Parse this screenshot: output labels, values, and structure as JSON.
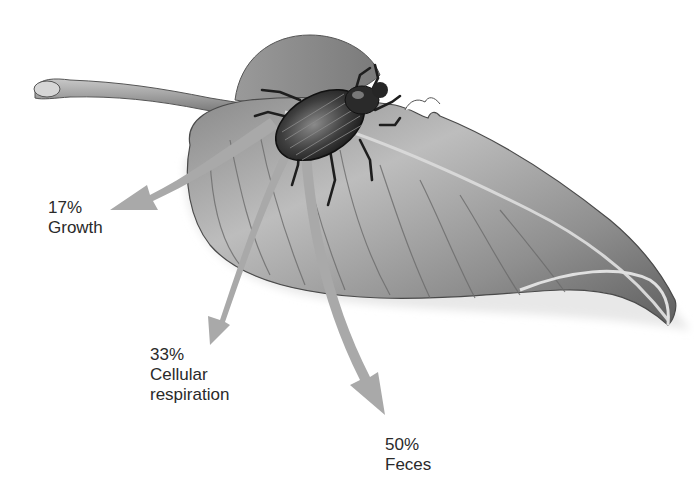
{
  "diagram": {
    "elements": {
      "organism": "beetle",
      "food_source": "leaf"
    },
    "colors": {
      "arrow": "#a9a9a9",
      "leaf_dark": "#6e6e6e",
      "leaf_light": "#cfcfcf",
      "text": "#2a2a2a",
      "background": "#ffffff"
    },
    "labels": [
      {
        "percent": "17%",
        "line1": "Growth",
        "line2": ""
      },
      {
        "percent": "33%",
        "line1": "Cellular",
        "line2": "respiration"
      },
      {
        "percent": "50%",
        "line1": "Feces",
        "line2": ""
      }
    ]
  }
}
